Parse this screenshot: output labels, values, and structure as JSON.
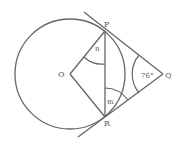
{
  "diagram": {
    "points": {
      "O": {
        "label": "O",
        "x": 70,
        "y": 74
      },
      "P": {
        "label": "P",
        "x": 105,
        "y": 31
      },
      "R": {
        "label": "R",
        "x": 105,
        "y": 117
      },
      "Q": {
        "label": "Q",
        "x": 163,
        "y": 74
      }
    },
    "circle": {
      "center": "O",
      "cx": 70,
      "cy": 74,
      "r": 55
    },
    "angles": {
      "n": {
        "label": "n",
        "at": "P",
        "between": [
          "O",
          "R"
        ]
      },
      "m": {
        "label": "m",
        "at": "R",
        "between": [
          "P",
          "Q"
        ]
      },
      "q": {
        "label": "76°",
        "at": "Q",
        "between": [
          "P",
          "R"
        ]
      }
    },
    "colors": {
      "stroke": "#666666",
      "text": "#555555",
      "background": "#ffffff"
    }
  }
}
